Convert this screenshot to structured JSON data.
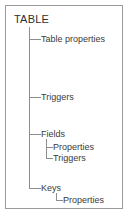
{
  "diagram": {
    "type": "tree",
    "title": "TABLE",
    "colors": {
      "border": "#9a9a9a",
      "connector": "#8d8d8d",
      "text": "#3b3b3b",
      "root_text": "#2f2f2f",
      "background": "#ffffff"
    },
    "root": {
      "label": "TABLE",
      "children": [
        {
          "label": "Table properties",
          "children": []
        },
        {
          "label": "Triggers",
          "children": []
        },
        {
          "label": "Fields",
          "children": [
            {
              "label": "Properties"
            },
            {
              "label": "Triggers"
            }
          ]
        },
        {
          "label": "Keys",
          "children": [
            {
              "label": "Properties"
            }
          ]
        }
      ]
    },
    "nodes": {
      "root": "TABLE",
      "table_properties": "Table properties",
      "triggers": "Triggers",
      "fields": "Fields",
      "fields_properties": "Properties",
      "fields_triggers": "Triggers",
      "keys": "Keys",
      "keys_properties": "Properties"
    }
  }
}
